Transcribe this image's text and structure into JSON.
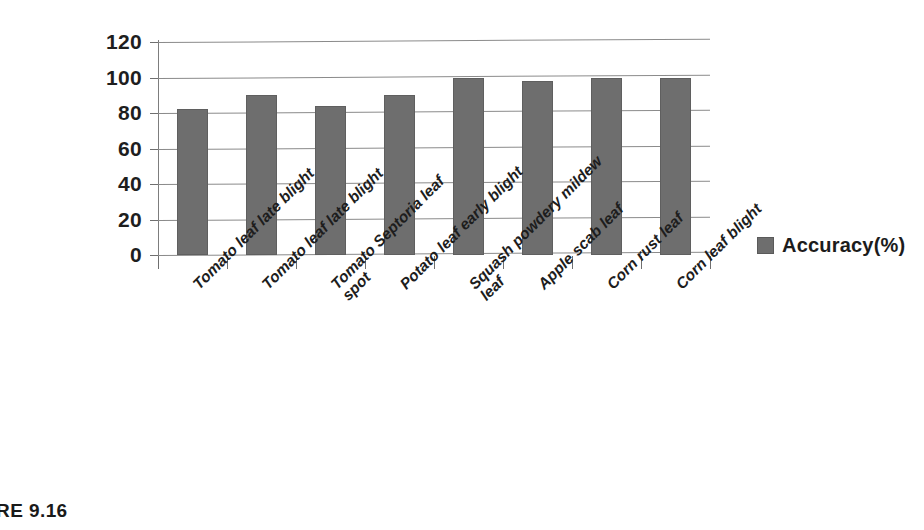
{
  "caption": "URE 9.16",
  "legend": {
    "marker_color": "#6e6e6e",
    "entries": [
      {
        "label": "Accuracy(%)",
        "color": "#6e6e6e",
        "icon": "square-swatch-icon"
      }
    ]
  },
  "axes": {
    "y_ticks": [
      "120",
      "100",
      "80",
      "60",
      "40",
      "20",
      "0"
    ],
    "y_min": 0,
    "y_max": 120,
    "y_step": 20
  },
  "chart_data": {
    "type": "bar",
    "title": "",
    "subtitle": "",
    "xlabel": "",
    "ylabel": "",
    "ylim": [
      0,
      120
    ],
    "ytick_step": 20,
    "grid": true,
    "legend_position": "right",
    "bar_color": "#6e6e6e",
    "categories": [
      "Tomato leaf late blight",
      "Tomato leaf late blight",
      "Tomato Septoria leaf spot",
      "Potato leaf early blight",
      "Squash powdery mildew leaf",
      "Apple scab leaf",
      "Corn rust leaf",
      "Corn leaf blight"
    ],
    "category_lines": [
      [
        "Tomato leaf late blight"
      ],
      [
        "Tomato leaf late blight"
      ],
      [
        "Tomato Septoria leaf",
        "spot"
      ],
      [
        "Potato leaf early blight"
      ],
      [
        "Squash powdery mildew",
        "leaf"
      ],
      [
        "Apple scab leaf"
      ],
      [
        "Corn rust leaf"
      ],
      [
        "Corn leaf blight"
      ]
    ],
    "series": [
      {
        "name": "Accuracy(%)",
        "values": [
          82,
          90,
          84,
          90,
          100,
          98,
          100,
          100
        ]
      }
    ]
  }
}
